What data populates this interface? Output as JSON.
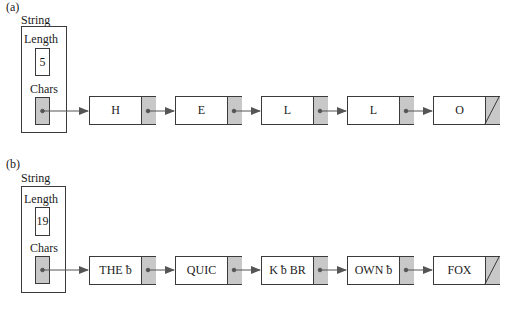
{
  "diagram": {
    "colors": {
      "line": "#3a3a3a",
      "pointer_fill": "#c8c8c8",
      "arrow": "#555555",
      "background": "#ffffff"
    },
    "blank_symbol": "ƀ",
    "parts": [
      {
        "label": "(a)",
        "record_title": "String",
        "length_label": "Length",
        "length_value": "5",
        "chars_label": "Chars",
        "nodes": [
          {
            "text": "H",
            "next": true
          },
          {
            "text": "E",
            "next": true
          },
          {
            "text": "L",
            "next": true
          },
          {
            "text": "L",
            "next": true
          },
          {
            "text": "O",
            "next": false
          }
        ]
      },
      {
        "label": "(b)",
        "record_title": "String",
        "length_label": "Length",
        "length_value": "19",
        "chars_label": "Chars",
        "nodes": [
          {
            "text": "THE ƀ",
            "next": true
          },
          {
            "text": "QUIC",
            "next": true
          },
          {
            "text": "K ƀ BR",
            "next": true
          },
          {
            "text": "OWN ƀ",
            "next": true
          },
          {
            "text": "FOX",
            "next": false
          }
        ]
      }
    ]
  }
}
